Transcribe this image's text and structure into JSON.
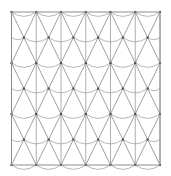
{
  "figure": {
    "kind": "line-diagram",
    "width": 171,
    "height": 176,
    "background_color": "#ffffff"
  },
  "frame": {
    "name": "boundary-rectangle",
    "x": 11.5,
    "y": 12.0,
    "width": 148.5,
    "height": 153.0,
    "stroke_color": "#8c8c8c",
    "stroke_width": 1.0,
    "fill": "none"
  },
  "lattice": {
    "description": "Triangular lattice of nodes in 7 rows; odd rows offset by half a column pitch.",
    "origin_x": 11.5,
    "origin_y": 12.0,
    "column_pitch": 24.75,
    "row_pitch": 25.5,
    "rows": 7,
    "columns_even_row": 7,
    "columns_odd_row": 6,
    "odd_row_offset": 12.375,
    "node": {
      "name": "lattice-node",
      "shape": "square-dot",
      "size": 2.1,
      "color": "#4f4f4f"
    }
  },
  "elements": {
    "vertical_lines": {
      "name": "vertical-strut",
      "stroke_color": "#9a9a9a",
      "stroke_width": 0.8,
      "count": 7
    },
    "diagonal_lines": {
      "name": "diagonal-strut",
      "stroke_color": "#8f8f8f",
      "stroke_width": 0.85,
      "description": "Two families of diagonals connecting each node to the two nodes in the row below, forming X crossings and V chevrons."
    },
    "arcs": {
      "name": "sagging-arc",
      "stroke_color": "#a3a3a3",
      "stroke_width": 0.8,
      "sag": 4.4,
      "description": "Quadratic arcs sagging downward between horizontally adjacent nodes within each row."
    }
  },
  "chart_data": {
    "type": "scatter",
    "xlabel": "",
    "ylabel": "",
    "xlim": [
      11.5,
      160.0
    ],
    "ylim": [
      12.0,
      165.0
    ],
    "grid": false,
    "legend": "none",
    "row_y_values": [
      12.0,
      37.5,
      63.0,
      88.5,
      114.0,
      139.5,
      165.0
    ],
    "column_x_values_even_rows": [
      11.5,
      36.25,
      61.0,
      85.75,
      110.5,
      135.25,
      160.0
    ],
    "column_x_values_odd_rows": [
      23.875,
      48.625,
      73.375,
      98.125,
      122.875,
      147.625
    ],
    "node_count": 91,
    "arc_count": 47,
    "annotations": []
  }
}
